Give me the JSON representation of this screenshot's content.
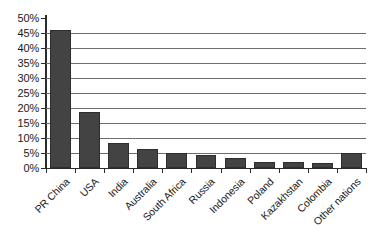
{
  "chart_data": {
    "type": "bar",
    "title": "",
    "subtitle": "",
    "xlabel": "",
    "ylabel": "",
    "ylim": [
      0,
      50
    ],
    "ytick_step": 5,
    "grid": true,
    "legend": false,
    "value_suffix": "%",
    "bar_color": "#434343",
    "bar_border_color": "#2e2e2e",
    "axis_color": "#2b2b2b",
    "gridline_color": "#6e6e6e",
    "ytick_labels": [
      "50%",
      "45%",
      "40%",
      "35%",
      "30%",
      "25%",
      "20%",
      "15%",
      "10%",
      "5%",
      "0%"
    ],
    "ytick_values": [
      50,
      45,
      40,
      35,
      30,
      25,
      20,
      15,
      10,
      5,
      0
    ],
    "categories": [
      "PR China",
      "USA",
      "India",
      "Australia",
      "South Africa",
      "Russia",
      "Indonesia",
      "Poland",
      "Kazakhstan",
      "Colombia",
      "Other nations"
    ],
    "values": [
      46.0,
      18.7,
      8.3,
      6.2,
      5.0,
      4.5,
      3.4,
      2.1,
      2.1,
      1.6,
      5.0
    ],
    "series": [
      {
        "name": "Share",
        "values": [
          46.0,
          18.7,
          8.3,
          6.2,
          5.0,
          4.5,
          3.4,
          2.1,
          2.1,
          1.6,
          5.0
        ]
      }
    ]
  }
}
